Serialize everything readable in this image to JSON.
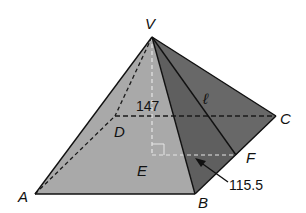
{
  "diagram": {
    "type": "square pyramid",
    "vertices": {
      "V": {
        "label": "V",
        "x": 152,
        "y": 37
      },
      "A": {
        "label": "A",
        "x": 35,
        "y": 194
      },
      "B": {
        "label": "B",
        "x": 195,
        "y": 194
      },
      "C": {
        "label": "C",
        "x": 276,
        "y": 116
      },
      "D": {
        "label": "D",
        "x": 115,
        "y": 116
      },
      "E": {
        "label": "E",
        "x": 152,
        "y": 155
      },
      "F": {
        "label": "F",
        "x": 236,
        "y": 155
      }
    },
    "labels": {
      "V": "V",
      "A": "A",
      "B": "B",
      "C": "C",
      "D": "D",
      "E": "E",
      "F": "F",
      "slant": "ℓ",
      "height": "147",
      "half_base": "115.5"
    },
    "colors": {
      "front_face": "#a8a8a8",
      "right_face": "#5a5a5a",
      "right_face_back": "#6b6b6b",
      "edge": "#111111",
      "hidden_dark": "#111111",
      "hidden_light": "#e8e8e8",
      "background": "#ffffff"
    }
  }
}
